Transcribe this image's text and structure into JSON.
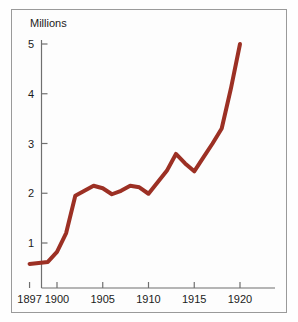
{
  "chart_data": {
    "type": "line",
    "title": "",
    "subtitle": "",
    "xlabel": "",
    "ylabel": "Millions",
    "ylabel_position": "top-left",
    "grid": false,
    "legend": null,
    "xlim": [
      1896.4,
      1921.5
    ],
    "ylim": [
      0,
      5.4
    ],
    "x_ticks": [
      1897,
      1900,
      1905,
      1910,
      1915,
      1920
    ],
    "x_tick_labels": [
      "1897",
      "1900",
      "1905",
      "1910",
      "1915",
      "1920"
    ],
    "y_ticks": [
      1,
      2,
      3,
      4,
      5
    ],
    "y_tick_labels": [
      "1",
      "2",
      "3",
      "4",
      "5"
    ],
    "series": [
      {
        "name": "Millions",
        "color": "#9c3024",
        "line_width": 4,
        "x": [
          1897,
          1898,
          1899,
          1900,
          1901,
          1902,
          1903,
          1904,
          1905,
          1906,
          1907,
          1908,
          1909,
          1910,
          1911,
          1912,
          1913,
          1914,
          1915,
          1916,
          1917,
          1918,
          1919,
          1920
        ],
        "values": [
          0.58,
          0.6,
          0.62,
          0.82,
          1.2,
          1.95,
          2.05,
          2.15,
          2.1,
          1.98,
          2.05,
          2.15,
          2.12,
          1.99,
          2.22,
          2.45,
          2.79,
          2.6,
          2.44,
          2.72,
          3.0,
          3.3,
          4.1,
          5.0
        ]
      }
    ]
  },
  "axis": {
    "y_title": "Millions"
  }
}
